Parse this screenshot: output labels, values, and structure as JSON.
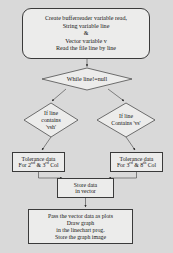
{
  "diagram": {
    "background_color": "#d9d9d9",
    "node_fill_color": "#ececeb",
    "node_border_color": "#3a3a3a",
    "text_color": "#141414"
  },
  "nodes": {
    "start": {
      "shape": "rounded-rectangle",
      "lines": [
        "Create bufferreader variable read,",
        "String variable line",
        "&",
        "Vector variable v",
        "Read the file line by line"
      ]
    },
    "while_decision": {
      "shape": "diamond",
      "lines": [
        "While line!=null"
      ]
    },
    "left_decision": {
      "shape": "diamond",
      "lines": [
        "If line",
        "contains",
        "'vsh'"
      ]
    },
    "right_decision": {
      "shape": "diamond",
      "lines": [
        "If line",
        "Contains  'vs'"
      ]
    },
    "left_process": {
      "shape": "rectangle",
      "lines": [
        "Tolerance data",
        "For 2nd & 3rd Col"
      ],
      "line2_parts": {
        "prefix": "For 2",
        "sup1": "nd",
        "middle": " & 3",
        "sup2": "rd",
        "suffix": " Col"
      }
    },
    "right_process": {
      "shape": "rectangle",
      "lines": [
        "Tolerance data",
        "For 3rd & 8th Col"
      ],
      "line2_parts": {
        "prefix": "For 3",
        "sup1": "rd",
        "middle": " & 8",
        "sup2": "th",
        "suffix": " Col"
      }
    },
    "store": {
      "shape": "rectangle",
      "lines": [
        "Store data",
        "in vector"
      ]
    },
    "end": {
      "shape": "rectangle",
      "lines": [
        "Pass the vector data as plots",
        "Draw graph",
        "in the linechart prog.",
        "Store the graph image"
      ]
    }
  },
  "edges": [
    {
      "from": "start",
      "to": "while_decision",
      "arrow": true
    },
    {
      "from": "while_decision",
      "to": "left_decision",
      "arrow": true
    },
    {
      "from": "while_decision",
      "to": "right_decision",
      "arrow": true
    },
    {
      "from": "left_decision",
      "to": "left_process",
      "arrow": true
    },
    {
      "from": "right_decision",
      "to": "right_process",
      "arrow": true
    },
    {
      "from": "left_process",
      "to": "store",
      "arrow": true
    },
    {
      "from": "right_process",
      "to": "store",
      "arrow": true
    },
    {
      "from": "store",
      "to": "end",
      "arrow": true
    }
  ]
}
